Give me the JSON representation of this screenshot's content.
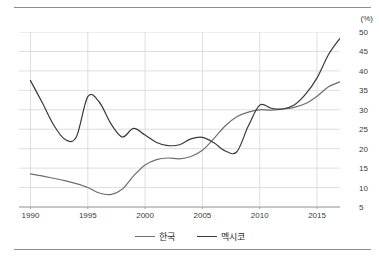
{
  "unit_label": "(%)",
  "legend": [
    {
      "label": "한국",
      "color": "#6e6e6e",
      "key": "korea"
    },
    {
      "label": "멕시코",
      "color": "#3a3a3a",
      "key": "mexico"
    }
  ],
  "chart_data": {
    "type": "line",
    "title": "",
    "subtitle": "",
    "xlabel": "",
    "ylabel": "(%)",
    "unit": "%",
    "grid": true,
    "legend_position": "bottom-center",
    "xlim": [
      1989,
      2017
    ],
    "ylim": [
      5,
      50
    ],
    "xticks": [
      1990,
      1995,
      2000,
      2005,
      2010,
      2015
    ],
    "yticks": [
      5,
      10,
      15,
      20,
      25,
      30,
      35,
      40,
      45,
      50
    ],
    "x": [
      1990,
      1991,
      1992,
      1993,
      1994,
      1995,
      1996,
      1997,
      1998,
      1999,
      2000,
      2001,
      2002,
      2003,
      2004,
      2005,
      2006,
      2007,
      2008,
      2009,
      2010,
      2011,
      2012,
      2013,
      2014,
      2015,
      2016,
      2017
    ],
    "series": [
      {
        "name": "한국",
        "color": "#6e6e6e",
        "values": [
          13.5,
          13.0,
          12.4,
          11.8,
          11.0,
          10.0,
          8.6,
          8.2,
          9.6,
          13.0,
          15.8,
          17.2,
          17.6,
          17.4,
          18.0,
          19.6,
          22.6,
          25.9,
          28.2,
          29.4,
          30.0,
          29.9,
          30.2,
          30.6,
          31.6,
          33.5,
          35.9,
          37.2
        ]
      },
      {
        "name": "멕시코",
        "color": "#3a3a3a",
        "values": [
          37.5,
          32.0,
          26.2,
          22.4,
          23.0,
          33.4,
          32.0,
          26.5,
          23.0,
          25.2,
          23.5,
          21.6,
          20.8,
          21.0,
          22.5,
          22.9,
          21.5,
          19.4,
          19.2,
          25.8,
          31.2,
          30.4,
          30.2,
          31.2,
          34.0,
          38.2,
          44.2,
          48.4
        ]
      }
    ],
    "annotations": []
  }
}
